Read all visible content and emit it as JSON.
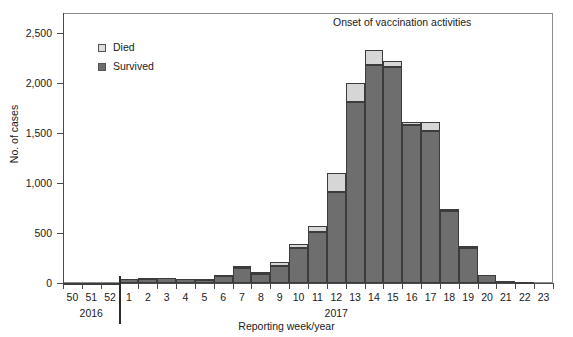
{
  "chart_data": {
    "type": "bar",
    "subtype": "stacked-bar-histogram",
    "title": "",
    "annotation": "Onset of vaccination activities",
    "xlabel": "Reporting week/year",
    "ylabel": "No. of cases",
    "ylim": [
      0,
      2700
    ],
    "yticks": [
      0,
      500,
      1000,
      1500,
      2000,
      2500
    ],
    "ytick_labels": [
      "0",
      "500",
      "1,000",
      "1,500",
      "2,000",
      "2,500"
    ],
    "grid": false,
    "legend_position": "upper-left-inside",
    "categories": [
      "50",
      "51",
      "52",
      "1",
      "2",
      "3",
      "4",
      "5",
      "6",
      "7",
      "8",
      "9",
      "10",
      "11",
      "12",
      "13",
      "14",
      "15",
      "16",
      "17",
      "18",
      "19",
      "20",
      "21",
      "22",
      "23"
    ],
    "year_groups": [
      {
        "label": "2016",
        "weeks": [
          "50",
          "51",
          "52"
        ]
      },
      {
        "label": "2017",
        "weeks": [
          "1",
          "2",
          "3",
          "4",
          "5",
          "6",
          "7",
          "8",
          "9",
          "10",
          "11",
          "12",
          "13",
          "14",
          "15",
          "16",
          "17",
          "18",
          "19",
          "20",
          "21",
          "22",
          "23"
        ]
      }
    ],
    "series": [
      {
        "name": "Survived",
        "color": "#6e6e6e",
        "values": [
          5,
          5,
          5,
          40,
          45,
          50,
          40,
          35,
          70,
          150,
          90,
          175,
          355,
          510,
          915,
          1810,
          2180,
          2165,
          1580,
          1520,
          725,
          355,
          80,
          25,
          10,
          0
        ]
      },
      {
        "name": "Died",
        "color": "#d6d6d6",
        "values": [
          0,
          0,
          0,
          5,
          5,
          5,
          5,
          5,
          10,
          20,
          20,
          35,
          35,
          65,
          185,
          190,
          150,
          60,
          35,
          90,
          20,
          20,
          5,
          0,
          0,
          0
        ]
      }
    ],
    "totals": [
      5,
      5,
      5,
      45,
      50,
      55,
      45,
      40,
      80,
      170,
      110,
      210,
      390,
      575,
      1100,
      2000,
      2330,
      2225,
      1615,
      1610,
      745,
      375,
      85,
      25,
      10,
      0
    ],
    "onset_marker": {
      "label": "Onset of vaccination activities",
      "position_between": [
        "52",
        "1"
      ]
    }
  },
  "legend": {
    "items": [
      {
        "label": "Died",
        "swatch": "died-swatch"
      },
      {
        "label": "Survived",
        "swatch": "survived-swatch"
      }
    ]
  },
  "colors": {
    "died": "#d6d6d6",
    "survived": "#6e6e6e",
    "axis": "#4a4a4a",
    "background": "#ffffff"
  }
}
